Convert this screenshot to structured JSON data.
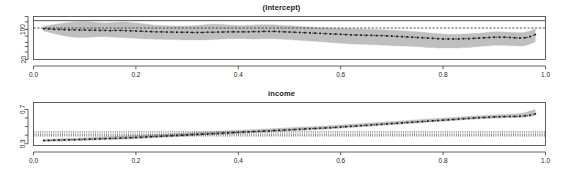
{
  "figure": {
    "background_color": "#ffffff",
    "axis_color": "#3a3a3a",
    "band_color": "#bfbfbf",
    "point_color": "#1a1a1a",
    "panel_count": 2
  },
  "chart_data": [
    {
      "type": "line",
      "title": "(Intercept)",
      "xlabel": "",
      "ylabel": "",
      "xlim": [
        0.0,
        1.0
      ],
      "ylim": [
        20,
        200
      ],
      "yscale": "log",
      "grid": false,
      "legend": null,
      "xticks": [
        "0.0",
        "0.2",
        "0.4",
        "0.6",
        "0.8",
        "1.0"
      ],
      "xtick_values": [
        0.0,
        0.2,
        0.4,
        0.6,
        0.8,
        1.0
      ],
      "yticks": [
        "100",
        "20"
      ],
      "ytick_values": [
        100,
        20
      ],
      "reference_lines": [
        {
          "style": "solid",
          "y": 160,
          "label": "ols-estimate"
        },
        {
          "style": "dashed",
          "y": 108,
          "label": "ols-confidence"
        }
      ],
      "x": [
        0.02,
        0.03,
        0.04,
        0.05,
        0.06,
        0.07,
        0.08,
        0.09,
        0.1,
        0.11,
        0.12,
        0.13,
        0.14,
        0.15,
        0.16,
        0.17,
        0.18,
        0.19,
        0.2,
        0.21,
        0.22,
        0.23,
        0.24,
        0.25,
        0.26,
        0.27,
        0.28,
        0.29,
        0.3,
        0.31,
        0.32,
        0.33,
        0.34,
        0.35,
        0.36,
        0.37,
        0.38,
        0.39,
        0.4,
        0.41,
        0.42,
        0.43,
        0.44,
        0.45,
        0.46,
        0.47,
        0.48,
        0.49,
        0.5,
        0.51,
        0.52,
        0.53,
        0.54,
        0.55,
        0.56,
        0.57,
        0.58,
        0.59,
        0.6,
        0.61,
        0.62,
        0.63,
        0.64,
        0.65,
        0.66,
        0.67,
        0.68,
        0.69,
        0.7,
        0.71,
        0.72,
        0.73,
        0.74,
        0.75,
        0.76,
        0.77,
        0.78,
        0.79,
        0.8,
        0.81,
        0.82,
        0.83,
        0.84,
        0.85,
        0.86,
        0.87,
        0.88,
        0.89,
        0.9,
        0.91,
        0.92,
        0.93,
        0.94,
        0.95,
        0.96,
        0.97,
        0.98
      ],
      "series": [
        {
          "name": "coefficient",
          "values": [
            104,
            103,
            101,
            100,
            99,
            98,
            98,
            97,
            97,
            96,
            96,
            95,
            95,
            94,
            95,
            95,
            94,
            93,
            92,
            91,
            90,
            89,
            88,
            88,
            87,
            87,
            86,
            86,
            86,
            85,
            85,
            85,
            86,
            86,
            87,
            87,
            88,
            88,
            88,
            88,
            88,
            89,
            89,
            90,
            90,
            90,
            89,
            88,
            87,
            86,
            85,
            84,
            83,
            82,
            81,
            80,
            79,
            78,
            77,
            76,
            75,
            74,
            74,
            73,
            73,
            72,
            72,
            71,
            70,
            69,
            68,
            67,
            66,
            65,
            64,
            63,
            62,
            61,
            60,
            60,
            60,
            60,
            61,
            61,
            62,
            63,
            64,
            65,
            66,
            66,
            66,
            65,
            64,
            63,
            64,
            68,
            76
          ]
        },
        {
          "name": "ci-upper",
          "values": [
            118,
            124,
            130,
            136,
            142,
            146,
            150,
            152,
            152,
            150,
            147,
            144,
            142,
            143,
            146,
            149,
            148,
            145,
            141,
            137,
            133,
            129,
            126,
            124,
            122,
            121,
            120,
            120,
            121,
            122,
            124,
            127,
            130,
            132,
            132,
            130,
            127,
            125,
            124,
            124,
            125,
            126,
            128,
            129,
            129,
            128,
            126,
            124,
            122,
            120,
            118,
            116,
            114,
            112,
            110,
            109,
            108,
            107,
            106,
            105,
            104,
            103,
            102,
            101,
            100,
            99,
            98,
            97,
            96,
            95,
            93,
            92,
            90,
            88,
            86,
            84,
            82,
            80,
            78,
            77,
            77,
            77,
            78,
            79,
            80,
            82,
            84,
            86,
            88,
            88,
            87,
            86,
            85,
            84,
            86,
            92,
            104
          ]
        },
        {
          "name": "ci-lower",
          "values": [
            92,
            86,
            80,
            75,
            71,
            68,
            66,
            65,
            65,
            66,
            67,
            68,
            68,
            67,
            66,
            65,
            64,
            63,
            62,
            61,
            60,
            60,
            59,
            59,
            58,
            58,
            58,
            57,
            57,
            57,
            57,
            57,
            57,
            58,
            59,
            60,
            61,
            61,
            61,
            61,
            60,
            60,
            60,
            61,
            61,
            61,
            60,
            59,
            58,
            57,
            56,
            55,
            54,
            53,
            52,
            51,
            50,
            49,
            48,
            47,
            46,
            46,
            45,
            45,
            44,
            44,
            43,
            43,
            42,
            42,
            41,
            41,
            40,
            40,
            39,
            38,
            38,
            37,
            37,
            37,
            37,
            37,
            38,
            38,
            39,
            40,
            41,
            42,
            43,
            43,
            43,
            42,
            42,
            41,
            42,
            46,
            52
          ]
        }
      ]
    },
    {
      "type": "line",
      "title": "income",
      "xlabel": "",
      "ylabel": "",
      "xlim": [
        0.0,
        1.0
      ],
      "ylim": [
        0.28,
        0.78
      ],
      "yscale": "linear",
      "grid": false,
      "legend": null,
      "xticks": [
        "0.0",
        "0.2",
        "0.4",
        "0.6",
        "0.8",
        "1.0"
      ],
      "xtick_values": [
        0.0,
        0.2,
        0.4,
        0.6,
        0.8,
        1.0
      ],
      "yticks": [
        "0.7",
        "0.3"
      ],
      "ytick_values": [
        0.7,
        0.3
      ],
      "reference_lines": [
        {
          "style": "dotted",
          "y": 0.438,
          "label": "ols-upper"
        },
        {
          "style": "dotted",
          "y": 0.412,
          "label": "ols-estimate"
        },
        {
          "style": "dotted",
          "y": 0.392,
          "label": "ols-lower"
        }
      ],
      "x": [
        0.02,
        0.03,
        0.04,
        0.05,
        0.06,
        0.07,
        0.08,
        0.09,
        0.1,
        0.11,
        0.12,
        0.13,
        0.14,
        0.15,
        0.16,
        0.17,
        0.18,
        0.19,
        0.2,
        0.21,
        0.22,
        0.23,
        0.24,
        0.25,
        0.26,
        0.27,
        0.28,
        0.29,
        0.3,
        0.31,
        0.32,
        0.33,
        0.34,
        0.35,
        0.36,
        0.37,
        0.38,
        0.39,
        0.4,
        0.41,
        0.42,
        0.43,
        0.44,
        0.45,
        0.46,
        0.47,
        0.48,
        0.49,
        0.5,
        0.51,
        0.52,
        0.53,
        0.54,
        0.55,
        0.56,
        0.57,
        0.58,
        0.59,
        0.6,
        0.61,
        0.62,
        0.63,
        0.64,
        0.65,
        0.66,
        0.67,
        0.68,
        0.69,
        0.7,
        0.71,
        0.72,
        0.73,
        0.74,
        0.75,
        0.76,
        0.77,
        0.78,
        0.79,
        0.8,
        0.81,
        0.82,
        0.83,
        0.84,
        0.85,
        0.86,
        0.87,
        0.88,
        0.89,
        0.9,
        0.91,
        0.92,
        0.93,
        0.94,
        0.95,
        0.96,
        0.97,
        0.98
      ],
      "series": [
        {
          "name": "coefficient",
          "values": [
            0.338,
            0.34,
            0.342,
            0.343,
            0.345,
            0.347,
            0.348,
            0.35,
            0.352,
            0.354,
            0.356,
            0.358,
            0.36,
            0.362,
            0.364,
            0.366,
            0.368,
            0.37,
            0.373,
            0.376,
            0.379,
            0.382,
            0.385,
            0.388,
            0.391,
            0.394,
            0.397,
            0.4,
            0.403,
            0.406,
            0.409,
            0.412,
            0.415,
            0.418,
            0.421,
            0.424,
            0.427,
            0.43,
            0.433,
            0.436,
            0.439,
            0.442,
            0.445,
            0.448,
            0.451,
            0.454,
            0.457,
            0.46,
            0.463,
            0.466,
            0.469,
            0.472,
            0.475,
            0.478,
            0.481,
            0.484,
            0.487,
            0.491,
            0.495,
            0.499,
            0.503,
            0.507,
            0.511,
            0.515,
            0.519,
            0.523,
            0.527,
            0.531,
            0.535,
            0.539,
            0.543,
            0.547,
            0.551,
            0.555,
            0.559,
            0.563,
            0.567,
            0.571,
            0.575,
            0.579,
            0.583,
            0.587,
            0.591,
            0.595,
            0.599,
            0.603,
            0.606,
            0.609,
            0.612,
            0.614,
            0.616,
            0.617,
            0.618,
            0.62,
            0.624,
            0.632,
            0.648
          ]
        },
        {
          "name": "ci-upper",
          "values": [
            0.352,
            0.354,
            0.356,
            0.358,
            0.36,
            0.363,
            0.365,
            0.368,
            0.371,
            0.374,
            0.377,
            0.38,
            0.382,
            0.385,
            0.387,
            0.39,
            0.392,
            0.394,
            0.397,
            0.4,
            0.403,
            0.406,
            0.409,
            0.412,
            0.415,
            0.418,
            0.421,
            0.424,
            0.427,
            0.43,
            0.433,
            0.436,
            0.439,
            0.442,
            0.445,
            0.448,
            0.451,
            0.454,
            0.457,
            0.46,
            0.463,
            0.466,
            0.469,
            0.472,
            0.475,
            0.478,
            0.481,
            0.484,
            0.487,
            0.49,
            0.493,
            0.496,
            0.499,
            0.502,
            0.505,
            0.508,
            0.511,
            0.515,
            0.519,
            0.523,
            0.527,
            0.531,
            0.535,
            0.539,
            0.543,
            0.547,
            0.551,
            0.555,
            0.559,
            0.563,
            0.567,
            0.571,
            0.575,
            0.579,
            0.583,
            0.587,
            0.591,
            0.595,
            0.599,
            0.603,
            0.607,
            0.611,
            0.615,
            0.619,
            0.623,
            0.627,
            0.63,
            0.633,
            0.636,
            0.638,
            0.641,
            0.643,
            0.646,
            0.652,
            0.662,
            0.682,
            0.7
          ]
        },
        {
          "name": "ci-lower",
          "values": [
            0.324,
            0.326,
            0.328,
            0.329,
            0.331,
            0.333,
            0.334,
            0.336,
            0.338,
            0.34,
            0.342,
            0.344,
            0.346,
            0.348,
            0.35,
            0.352,
            0.354,
            0.356,
            0.359,
            0.362,
            0.365,
            0.368,
            0.371,
            0.374,
            0.377,
            0.38,
            0.383,
            0.386,
            0.389,
            0.392,
            0.395,
            0.398,
            0.401,
            0.404,
            0.407,
            0.41,
            0.413,
            0.416,
            0.419,
            0.422,
            0.425,
            0.428,
            0.431,
            0.434,
            0.437,
            0.44,
            0.443,
            0.446,
            0.449,
            0.452,
            0.455,
            0.458,
            0.461,
            0.464,
            0.467,
            0.47,
            0.473,
            0.477,
            0.481,
            0.485,
            0.489,
            0.493,
            0.497,
            0.501,
            0.505,
            0.509,
            0.513,
            0.517,
            0.521,
            0.525,
            0.529,
            0.533,
            0.537,
            0.541,
            0.545,
            0.549,
            0.553,
            0.557,
            0.561,
            0.565,
            0.569,
            0.573,
            0.577,
            0.581,
            0.585,
            0.589,
            0.592,
            0.595,
            0.598,
            0.6,
            0.602,
            0.603,
            0.604,
            0.606,
            0.61,
            0.618,
            0.63
          ]
        }
      ]
    }
  ]
}
